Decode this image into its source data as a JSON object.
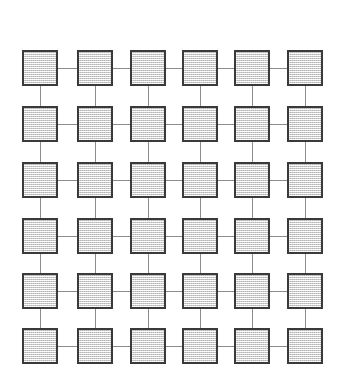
{
  "figure": {
    "type": "diagram",
    "background_color": "#ffffff",
    "width": 342,
    "height": 389
  },
  "grid": {
    "rows": 6,
    "columns": 6,
    "node_count": 36,
    "node_shape": "square",
    "node_size": 36,
    "node_fill_color": "#dcdcdc",
    "node_fill_pattern": "dithered-stipple",
    "node_border_color": "#3a3a3a",
    "node_border_width": 2,
    "link_color": "#8c8c8c",
    "link_width": 1,
    "column_centers": [
      40,
      95,
      148,
      200,
      252,
      305
    ],
    "row_centers": [
      68,
      124,
      180,
      236,
      291,
      346
    ],
    "horizontal_link_count": 30,
    "vertical_link_count": 30
  },
  "nodes": [
    {
      "id": "n-1-1",
      "row": 1,
      "col": 1,
      "cx": 40,
      "cy": 68
    },
    {
      "id": "n-1-2",
      "row": 1,
      "col": 2,
      "cx": 95,
      "cy": 68
    },
    {
      "id": "n-1-3",
      "row": 1,
      "col": 3,
      "cx": 148,
      "cy": 68
    },
    {
      "id": "n-1-4",
      "row": 1,
      "col": 4,
      "cx": 200,
      "cy": 68
    },
    {
      "id": "n-1-5",
      "row": 1,
      "col": 5,
      "cx": 252,
      "cy": 68
    },
    {
      "id": "n-1-6",
      "row": 1,
      "col": 6,
      "cx": 305,
      "cy": 68
    },
    {
      "id": "n-2-1",
      "row": 2,
      "col": 1,
      "cx": 40,
      "cy": 124
    },
    {
      "id": "n-2-2",
      "row": 2,
      "col": 2,
      "cx": 95,
      "cy": 124
    },
    {
      "id": "n-2-3",
      "row": 2,
      "col": 3,
      "cx": 148,
      "cy": 124
    },
    {
      "id": "n-2-4",
      "row": 2,
      "col": 4,
      "cx": 200,
      "cy": 124
    },
    {
      "id": "n-2-5",
      "row": 2,
      "col": 5,
      "cx": 252,
      "cy": 124
    },
    {
      "id": "n-2-6",
      "row": 2,
      "col": 6,
      "cx": 305,
      "cy": 124
    },
    {
      "id": "n-3-1",
      "row": 3,
      "col": 1,
      "cx": 40,
      "cy": 180
    },
    {
      "id": "n-3-2",
      "row": 3,
      "col": 2,
      "cx": 95,
      "cy": 180
    },
    {
      "id": "n-3-3",
      "row": 3,
      "col": 3,
      "cx": 148,
      "cy": 180
    },
    {
      "id": "n-3-4",
      "row": 3,
      "col": 4,
      "cx": 200,
      "cy": 180
    },
    {
      "id": "n-3-5",
      "row": 3,
      "col": 5,
      "cx": 252,
      "cy": 180
    },
    {
      "id": "n-3-6",
      "row": 3,
      "col": 6,
      "cx": 305,
      "cy": 180
    },
    {
      "id": "n-4-1",
      "row": 4,
      "col": 1,
      "cx": 40,
      "cy": 236
    },
    {
      "id": "n-4-2",
      "row": 4,
      "col": 2,
      "cx": 95,
      "cy": 236
    },
    {
      "id": "n-4-3",
      "row": 4,
      "col": 3,
      "cx": 148,
      "cy": 236
    },
    {
      "id": "n-4-4",
      "row": 4,
      "col": 4,
      "cx": 200,
      "cy": 236
    },
    {
      "id": "n-4-5",
      "row": 4,
      "col": 5,
      "cx": 252,
      "cy": 236
    },
    {
      "id": "n-4-6",
      "row": 4,
      "col": 6,
      "cx": 305,
      "cy": 236
    },
    {
      "id": "n-5-1",
      "row": 5,
      "col": 1,
      "cx": 40,
      "cy": 291
    },
    {
      "id": "n-5-2",
      "row": 5,
      "col": 2,
      "cx": 95,
      "cy": 291
    },
    {
      "id": "n-5-3",
      "row": 5,
      "col": 3,
      "cx": 148,
      "cy": 291
    },
    {
      "id": "n-5-4",
      "row": 5,
      "col": 4,
      "cx": 200,
      "cy": 291
    },
    {
      "id": "n-5-5",
      "row": 5,
      "col": 5,
      "cx": 252,
      "cy": 291
    },
    {
      "id": "n-5-6",
      "row": 5,
      "col": 6,
      "cx": 305,
      "cy": 291
    },
    {
      "id": "n-6-1",
      "row": 6,
      "col": 1,
      "cx": 40,
      "cy": 346
    },
    {
      "id": "n-6-2",
      "row": 6,
      "col": 2,
      "cx": 95,
      "cy": 346
    },
    {
      "id": "n-6-3",
      "row": 6,
      "col": 3,
      "cx": 148,
      "cy": 346
    },
    {
      "id": "n-6-4",
      "row": 6,
      "col": 4,
      "cx": 200,
      "cy": 346
    },
    {
      "id": "n-6-5",
      "row": 6,
      "col": 5,
      "cx": 252,
      "cy": 346
    },
    {
      "id": "n-6-6",
      "row": 6,
      "col": 6,
      "cx": 305,
      "cy": 346
    }
  ]
}
